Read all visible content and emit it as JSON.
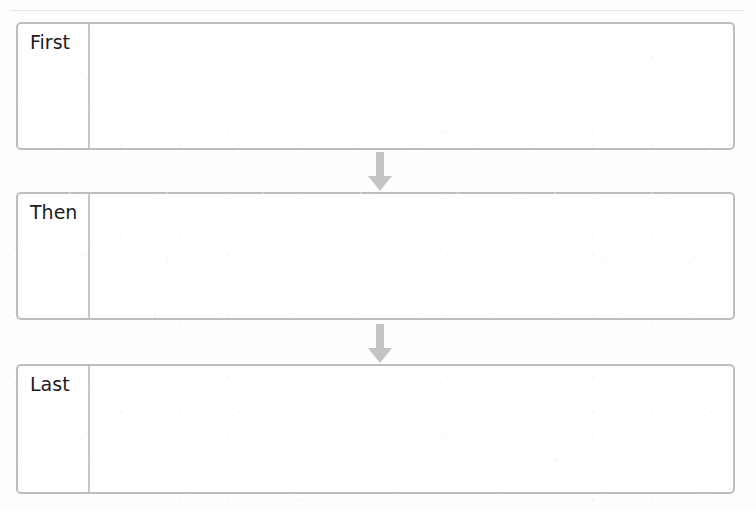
{
  "document": {
    "title": "Helen Keller",
    "title_note": "cropped at top edge of scan"
  },
  "organizer": {
    "type": "sequencing-graphic-organizer",
    "steps": [
      {
        "label": "First",
        "content": ""
      },
      {
        "label": "Then",
        "content": ""
      },
      {
        "label": "Last",
        "content": ""
      }
    ],
    "connectors": [
      {
        "icon": "down-arrow-icon",
        "from": "First",
        "to": "Then"
      },
      {
        "icon": "down-arrow-icon",
        "from": "Then",
        "to": "Last"
      }
    ]
  },
  "colors": {
    "page_background": "#fefefe",
    "box_border": "#bdbdc0",
    "divider": "#c6c6c9",
    "label_text": "#1b1b1d",
    "title_text": "#4a4a4d",
    "arrow_fill": "#c4c4c7",
    "rule": "#e4e4e6"
  }
}
